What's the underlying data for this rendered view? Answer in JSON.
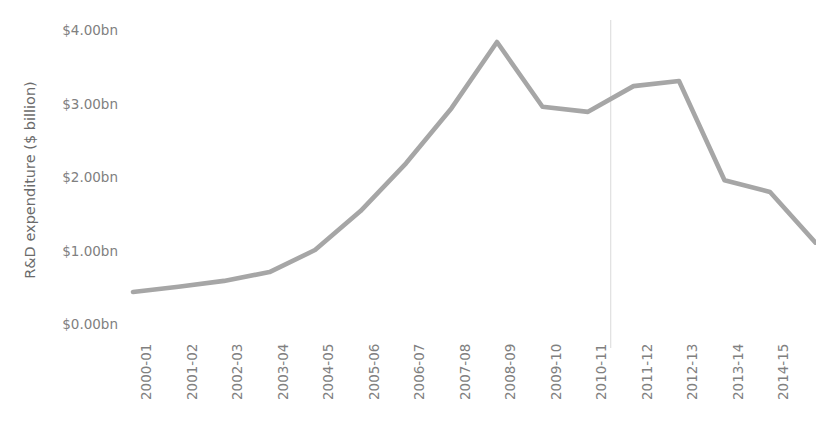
{
  "chart_data": {
    "type": "line",
    "title": "",
    "subtitle": "",
    "xlabel": "",
    "ylabel": "R&D expenditure ($ billion)",
    "grid": false,
    "legend": "none",
    "ylim": [
      0,
      4
    ],
    "ytick_labels": [
      "$4.00bn",
      "$3.00bn",
      "$2.00bn",
      "$1.00bn",
      "$0.00bn"
    ],
    "ytick_values": [
      4,
      3,
      2,
      1,
      0
    ],
    "categories": [
      "2000-01",
      "2001-02",
      "2002-03",
      "2003-04",
      "2004-05",
      "2005-06",
      "2006-07",
      "2007-08",
      "2008-09",
      "2009-10",
      "2010-11",
      "2011-12",
      "2012-13",
      "2013-14",
      "2014-15",
      "2015-16"
    ],
    "values": [
      0.45,
      0.52,
      0.6,
      0.72,
      1.02,
      1.55,
      2.2,
      2.95,
      3.85,
      2.97,
      2.9,
      3.25,
      3.32,
      1.97,
      1.81,
      1.12
    ],
    "series": [
      {
        "name": "R&D expenditure",
        "color": "#a6a6a6",
        "values": [
          0.45,
          0.52,
          0.6,
          0.72,
          1.02,
          1.55,
          2.2,
          2.95,
          3.85,
          2.97,
          2.9,
          3.25,
          3.32,
          1.97,
          1.81,
          1.12
        ]
      }
    ],
    "annotations": [
      {
        "type": "vertical-divider",
        "after_category": "2010-11",
        "between": [
          "2010-11",
          "2011-12"
        ],
        "color": "#d9d9d9"
      }
    ],
    "colors": {
      "line": "#a6a6a6",
      "tick_text": "#808080",
      "axis_title": "#6b6b6b",
      "divider": "#d9d9d9",
      "background": "#ffffff"
    }
  }
}
